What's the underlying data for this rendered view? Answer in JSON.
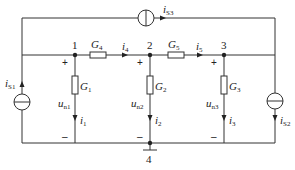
{
  "diagram": {
    "type": "circuit",
    "nodes": [
      {
        "id": "1",
        "label": "1"
      },
      {
        "id": "2",
        "label": "2"
      },
      {
        "id": "3",
        "label": "3"
      },
      {
        "id": "4",
        "label": "4",
        "role": "reference"
      }
    ],
    "conductances": [
      {
        "name": "G",
        "sub": "1",
        "between": [
          "1",
          "4"
        ]
      },
      {
        "name": "G",
        "sub": "2",
        "between": [
          "2",
          "4"
        ]
      },
      {
        "name": "G",
        "sub": "3",
        "between": [
          "3",
          "4"
        ]
      },
      {
        "name": "G",
        "sub": "4",
        "between": [
          "1",
          "2"
        ]
      },
      {
        "name": "G",
        "sub": "5",
        "between": [
          "2",
          "3"
        ]
      }
    ],
    "currents": [
      {
        "name": "i",
        "sub": "1"
      },
      {
        "name": "i",
        "sub": "2"
      },
      {
        "name": "i",
        "sub": "3"
      },
      {
        "name": "i",
        "sub": "4"
      },
      {
        "name": "i",
        "sub": "5"
      }
    ],
    "sources": [
      {
        "name": "i",
        "sub": "S1"
      },
      {
        "name": "i",
        "sub": "S2"
      },
      {
        "name": "i",
        "sub": "S3"
      }
    ],
    "voltages": [
      {
        "name": "u",
        "sub": "n1"
      },
      {
        "name": "u",
        "sub": "n2"
      },
      {
        "name": "u",
        "sub": "n3"
      }
    ],
    "plus": "+",
    "minus": "–"
  }
}
